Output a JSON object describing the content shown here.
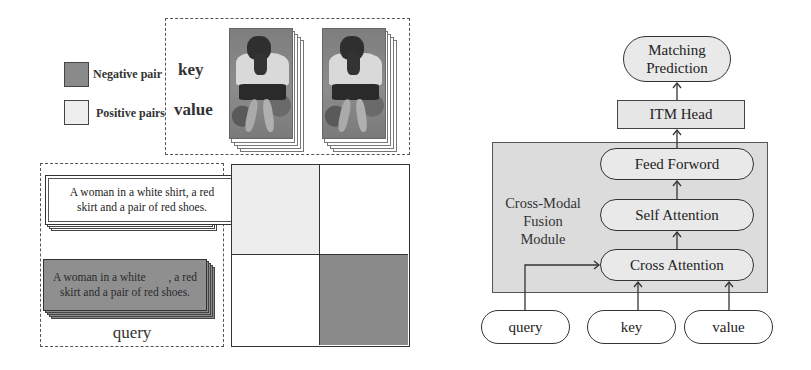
{
  "legend": {
    "items": [
      {
        "label": "Negative pair",
        "color": "#8a8a8a"
      },
      {
        "label": "Positive pairs",
        "color": "#eeeeee"
      }
    ]
  },
  "key_value_panel": {
    "key_label": "key",
    "value_label": "value",
    "images": [
      "person-image-1",
      "person-image-2"
    ]
  },
  "query_panel": {
    "positive_text": "A woman in a white shirt, a red skirt and a pair of red shoes.",
    "negative_text_line1": "A woman in a white        , a red",
    "negative_text_line2": "skirt and a pair of red shoes.",
    "label": "query"
  },
  "matrix": {
    "cells": [
      {
        "row": 0,
        "col": 0,
        "type": "positive",
        "color": "#ededed"
      },
      {
        "row": 0,
        "col": 1,
        "type": "empty",
        "color": "#ffffff"
      },
      {
        "row": 1,
        "col": 0,
        "type": "empty",
        "color": "#ffffff"
      },
      {
        "row": 1,
        "col": 1,
        "type": "negative",
        "color": "#8a8a8a"
      }
    ]
  },
  "architecture": {
    "output": {
      "line1": "Matching",
      "line2": "Prediction"
    },
    "head": "ITM Head",
    "module_label": {
      "line1": "Cross-Modal",
      "line2": "Fusion",
      "line3": "Module"
    },
    "layers": [
      "Feed Forword",
      "Self Attention",
      "Cross Attention"
    ],
    "inputs": [
      "query",
      "key",
      "value"
    ]
  }
}
